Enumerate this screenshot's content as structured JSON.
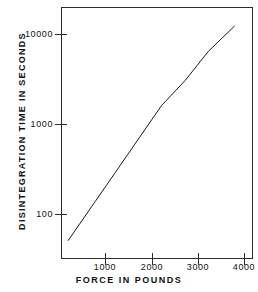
{
  "chart_data": {
    "type": "line",
    "title": "",
    "xlabel": "FORCE IN POUNDS",
    "ylabel": "DISINTEGRATION TIME IN SECONDS",
    "xscale": "linear",
    "yscale": "log",
    "xlim": [
      350,
      4450
    ],
    "ylim": [
      30,
      20000
    ],
    "grid": false,
    "legend": null,
    "xticks": [
      {
        "value": 1000,
        "label": "1000"
      },
      {
        "value": 2000,
        "label": "2000"
      },
      {
        "value": 3000,
        "label": "3000"
      },
      {
        "value": 4000,
        "label": "4000"
      }
    ],
    "yticks": [
      {
        "value": 10000,
        "label": "10000"
      },
      {
        "value": 1000,
        "label": "1000"
      },
      {
        "value": 100,
        "label": "100"
      }
    ],
    "series": [
      {
        "name": "disintegration time vs force",
        "x": [
          500,
          1000,
          1500,
          2000,
          2500,
          3000,
          3500,
          4060
        ],
        "y": [
          48,
          115,
          275,
          660,
          1580,
          3000,
          6400,
          12300
        ],
        "color": "#1b1b1b",
        "linewidth": 1
      }
    ],
    "annotations": []
  },
  "axes": {
    "x_title": "FORCE IN POUNDS",
    "y_title": "DISINTEGRATION TIME IN SECONDS"
  },
  "colors": {
    "line": "#1b1b1b",
    "frame": "#2b2b2b",
    "text": "#111111",
    "background": "#ffffff"
  }
}
